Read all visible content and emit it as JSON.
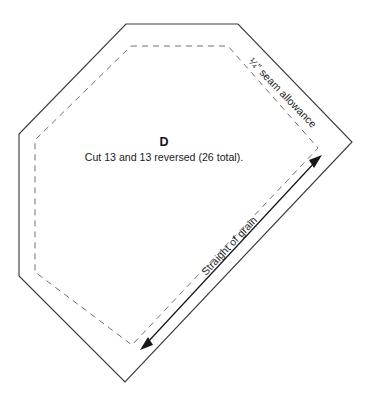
{
  "sheet": {
    "background_color": "#ffffff",
    "ink_color": "#3a3a42",
    "seam_line_color": "#6e6e78",
    "grain_color": "#18181c"
  },
  "piece": {
    "letter": "D",
    "caption": "Cut 13 and 13 reversed (26 total).",
    "cut_line_name": "cutting-line",
    "seam_line_name": "stitching-line"
  },
  "annotations": {
    "seam_allowance": "¼\" seam allowance",
    "grain": "Straight of grain"
  },
  "geometry": {
    "cut_polygon": "126,24 238,24 352,142 125,382 19,276 19,134",
    "seam_polygon": "131,46 228,46 318,148 132,345 35,272 35,140",
    "grain_line": {
      "x1": 140,
      "y1": 350,
      "x2": 322,
      "y2": 155
    },
    "seam_label_anchor": {
      "x": 248,
      "y": 62,
      "rotate": 46
    },
    "grain_label_anchor": {
      "x": 206,
      "y": 276,
      "rotate": -47
    },
    "letter_anchor": {
      "x": 164,
      "y": 146
    },
    "caption_anchor": {
      "x": 164,
      "y": 161
    }
  }
}
